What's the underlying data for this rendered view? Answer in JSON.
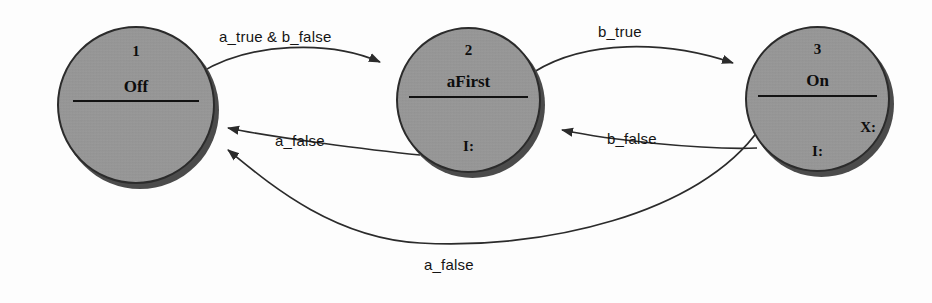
{
  "diagram": {
    "type": "state-machine",
    "background_color": "#fdfdfd",
    "node_fill_color": "#9c9c9c",
    "node_stroke_color": "#2b2b2b",
    "edge_color": "#2b2b2b"
  },
  "nodes": [
    {
      "id": "1",
      "name": "Off",
      "note": "",
      "note_2": "",
      "cx": 136,
      "cy": 105,
      "r": 79
    },
    {
      "id": "2",
      "name": "aFirst",
      "note": "I:",
      "note_2": "",
      "cx": 468,
      "cy": 100,
      "r": 72
    },
    {
      "id": "3",
      "name": "On",
      "note": "I:",
      "note_2": "X:",
      "cx": 817,
      "cy": 100,
      "r": 72
    }
  ],
  "edges": [
    {
      "from": "1",
      "to": "2",
      "label": "a_true & b_false",
      "label_x": 219,
      "label_y": 28
    },
    {
      "from": "2",
      "to": "3",
      "label": "b_true",
      "label_x": 598,
      "label_y": 23
    },
    {
      "from": "2",
      "to": "1",
      "label": "a_false",
      "label_y": 132,
      "label_x": 275
    },
    {
      "from": "3",
      "to": "2",
      "label": "b_false",
      "label_x": 607,
      "label_y": 130
    },
    {
      "from": "3",
      "to": "1",
      "label": "a_false",
      "label_x": 424,
      "label_y": 256
    }
  ]
}
